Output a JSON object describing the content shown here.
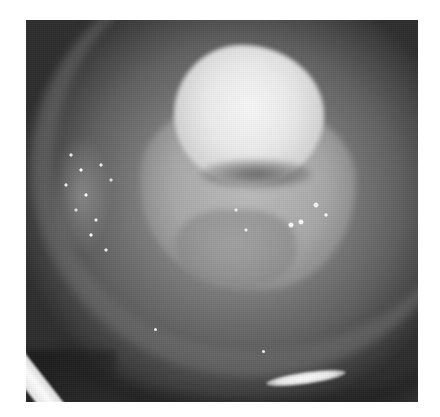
{
  "image": {
    "description": "Grayscale clinical close-up photograph showing a bright, irregular whitish mass at center over a gray circular field, with a curved white instrument edge at lower left and a bright light reflex at lower right",
    "palette": {
      "background": "#ffffff",
      "field_center": "#8a8a8a",
      "field_edge": "#2c2c2c",
      "lesion_highlight": "#f8f8f8",
      "instrument": "#ffffff"
    }
  }
}
